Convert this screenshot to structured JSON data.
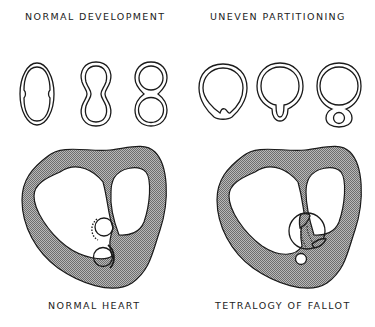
{
  "labels": {
    "top_left": "NORMAL DEVELOPMENT",
    "top_right": "UNEVEN PARTITIONING",
    "bottom_left": "NORMAL HEART",
    "bottom_right": "TETRALOGY OF FALLOT"
  },
  "colors": {
    "line": "#1a1a1a",
    "hatch": "#9a9a9a",
    "background": "#ffffff"
  }
}
